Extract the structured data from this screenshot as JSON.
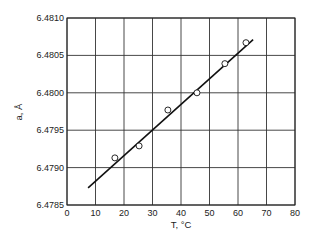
{
  "chart_data": {
    "type": "scatter",
    "title": "",
    "xlabel": "T, °C",
    "ylabel": "a, Å",
    "xlim": [
      0,
      80
    ],
    "ylim": [
      6.4785,
      6.481
    ],
    "grid": true,
    "legend": null,
    "x_ticks": [
      "0",
      "10",
      "20",
      "30",
      "40",
      "50",
      "60",
      "70",
      "80"
    ],
    "y_ticks": [
      "6.4785",
      "6.4790",
      "6.4795",
      "6.4800",
      "6.4805",
      "6.4810"
    ],
    "series": [
      {
        "name": "measured",
        "style": "open-circle",
        "x": [
          16.8,
          25.3,
          35.4,
          45.6,
          55.4,
          62.8
        ],
        "y": [
          6.47913,
          6.47929,
          6.47977,
          6.48,
          6.48039,
          6.48067
        ]
      },
      {
        "name": "linear fit",
        "style": "line",
        "x": [
          7.4,
          65.3
        ],
        "y": [
          6.47873,
          6.48071
        ]
      }
    ]
  }
}
